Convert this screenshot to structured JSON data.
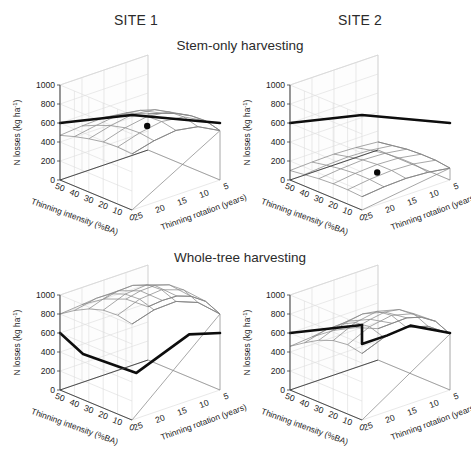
{
  "figure": {
    "columns": [
      {
        "label": "SITE 1"
      },
      {
        "label": "SITE 2"
      }
    ],
    "rows": [
      {
        "label": "Stem-only harvesting"
      },
      {
        "label": "Whole-tree harvesting"
      }
    ]
  },
  "axes": {
    "z_title": "N losses (kg ha",
    "z_title_sup": "-1",
    "z_title_close": ")",
    "z_ticks": [
      "0",
      "200",
      "400",
      "600",
      "800",
      "1000"
    ],
    "x_title": "Thinning intensity (%BA)",
    "x_ticks": [
      "50",
      "40",
      "30",
      "20",
      "10",
      "0"
    ],
    "y_title": "Thinning rotation (years)",
    "y_ticks": [
      "25",
      "20",
      "15",
      "10",
      "5"
    ]
  },
  "colors": {
    "mesh": "#8a8a8a",
    "reference_line": "#0d0d0d",
    "marker": "#0a0a0a",
    "wall": "#fdfdfd",
    "background": "#ffffff"
  },
  "chart_data": {
    "type": "surface",
    "xlabel": "Thinning intensity (%BA)",
    "ylabel": "Thinning rotation (years)",
    "zlabel": "N losses (kg ha-1)",
    "zlim": [
      0,
      1000
    ],
    "x": [
      50,
      40,
      30,
      20,
      10,
      0
    ],
    "y": [
      25,
      20,
      15,
      10,
      5
    ],
    "grid": true,
    "legend": "none",
    "panels": [
      {
        "name": "site1-stem-only",
        "site": "SITE 1",
        "harvesting": "Stem-only harvesting",
        "marker": {
          "x": 20,
          "y": 15,
          "z": 600,
          "style": "filled-circle"
        },
        "reference_line_z": 600,
        "z": [
          [
            470,
            520,
            560,
            590,
            600,
            590
          ],
          [
            490,
            560,
            620,
            660,
            670,
            650
          ],
          [
            500,
            590,
            660,
            700,
            710,
            680
          ],
          [
            470,
            560,
            630,
            670,
            680,
            640
          ],
          [
            380,
            450,
            510,
            550,
            560,
            520
          ]
        ]
      },
      {
        "name": "site2-stem-only",
        "site": "SITE 2",
        "harvesting": "Stem-only harvesting",
        "marker": {
          "x": 20,
          "y": 15,
          "z": 110,
          "style": "filled-circle"
        },
        "reference_line_z": 600,
        "z": [
          [
            100,
            120,
            140,
            150,
            150,
            140
          ],
          [
            110,
            140,
            165,
            180,
            180,
            165
          ],
          [
            115,
            150,
            180,
            195,
            195,
            175
          ],
          [
            105,
            140,
            170,
            185,
            185,
            160
          ],
          [
            85,
            110,
            135,
            145,
            145,
            125
          ]
        ]
      },
      {
        "name": "site1-whole-tree",
        "site": "SITE 1",
        "harvesting": "Whole-tree harvesting",
        "marker": null,
        "reference_line_z": 600,
        "z": [
          [
            800,
            900,
            980,
            1030,
            1040,
            1010
          ],
          [
            820,
            950,
            1060,
            1120,
            1130,
            1080
          ],
          [
            800,
            950,
            1070,
            1140,
            1150,
            1090
          ],
          [
            720,
            870,
            990,
            1060,
            1070,
            1000
          ],
          [
            560,
            690,
            800,
            860,
            870,
            800
          ]
        ]
      },
      {
        "name": "site2-whole-tree",
        "site": "SITE 2",
        "harvesting": "Whole-tree harvesting",
        "marker": null,
        "reference_line_z": 600,
        "reference_line_step": true,
        "z": [
          [
            460,
            560,
            650,
            710,
            730,
            700
          ],
          [
            480,
            620,
            740,
            820,
            840,
            790
          ],
          [
            470,
            630,
            770,
            860,
            880,
            820
          ],
          [
            420,
            570,
            710,
            800,
            820,
            750
          ],
          [
            330,
            450,
            570,
            640,
            660,
            590
          ]
        ]
      }
    ]
  }
}
